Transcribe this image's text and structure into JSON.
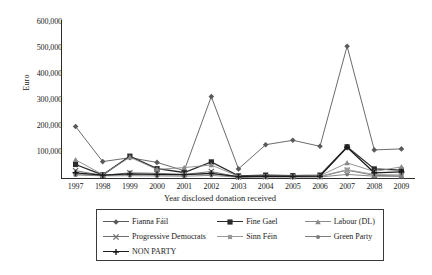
{
  "chart_data": {
    "type": "line",
    "title": "",
    "xlabel": "Year disclosed donation received",
    "ylabel": "Euro",
    "categories": [
      "1997",
      "1998",
      "1999",
      "2000",
      "2001",
      "2002",
      "2003",
      "2004",
      "2005",
      "2006",
      "2007",
      "2008",
      "2009"
    ],
    "ylim": [
      0,
      600000
    ],
    "yticks": [
      "100,000",
      "200,000",
      "300,000",
      "400,000",
      "500,000",
      "600,000"
    ],
    "ytick_values": [
      100000,
      200000,
      300000,
      400000,
      500000,
      600000
    ],
    "grid": false,
    "legend_position": "bottom",
    "series": [
      {
        "name": "Fianna Fáil",
        "marker": "diamond",
        "color": "#5a5a5a",
        "values": [
          198000,
          63000,
          78000,
          60000,
          28000,
          313000,
          35000,
          128000,
          145000,
          122000,
          507000,
          108000,
          112000
        ]
      },
      {
        "name": "Fine Gael",
        "marker": "square",
        "color": "#2b2b2b",
        "values": [
          52000,
          12000,
          84000,
          36000,
          21000,
          62000,
          8000,
          11000,
          9000,
          11000,
          120000,
          35000,
          30000
        ]
      },
      {
        "name": "Labour (DL)",
        "marker": "triangle",
        "color": "#8a8a8a",
        "values": [
          70000,
          13000,
          80000,
          33000,
          40000,
          50000,
          6000,
          9000,
          8000,
          9000,
          58000,
          25000,
          43000
        ]
      },
      {
        "name": "Progressive Democrats",
        "marker": "cross-x",
        "color": "#6e6e6e",
        "values": [
          28000,
          10000,
          20000,
          18000,
          14000,
          25000,
          4000,
          5000,
          5000,
          5000,
          30000,
          10000,
          8000
        ]
      },
      {
        "name": "Sinn Féin",
        "marker": "small-square",
        "color": "#9a9a9a",
        "values": [
          14000,
          10000,
          14000,
          12000,
          12000,
          16000,
          4000,
          6000,
          6000,
          7000,
          32000,
          14000,
          12000
        ]
      },
      {
        "name": "Green Party",
        "marker": "circle",
        "color": "#7d7d7d",
        "values": [
          12000,
          8000,
          9000,
          8000,
          7000,
          10000,
          3000,
          4000,
          4000,
          4000,
          14000,
          7000,
          6000
        ]
      },
      {
        "name": "NON PARTY",
        "marker": "plus",
        "color": "#1c1c1c",
        "values": [
          20000,
          11000,
          16000,
          14000,
          13000,
          18000,
          5000,
          7000,
          6000,
          7000,
          118000,
          20000,
          24000
        ]
      }
    ]
  },
  "legend": {
    "rows": [
      [
        {
          "label": "Fianna Fáil",
          "marker": "diamond",
          "color": "#5a5a5a"
        },
        {
          "label": "Fine Gael",
          "marker": "square",
          "color": "#2b2b2b"
        },
        {
          "label": "Labour (DL)",
          "marker": "triangle",
          "color": "#8a8a8a"
        }
      ],
      [
        {
          "label": "Progressive Democrats",
          "marker": "cross-x",
          "color": "#6e6e6e"
        },
        {
          "label": "Sinn Féin",
          "marker": "small-square",
          "color": "#9a9a9a"
        },
        {
          "label": "Green Party",
          "marker": "circle",
          "color": "#7d7d7d"
        }
      ],
      [
        {
          "label": "NON PARTY",
          "marker": "plus",
          "color": "#1c1c1c"
        }
      ]
    ]
  }
}
